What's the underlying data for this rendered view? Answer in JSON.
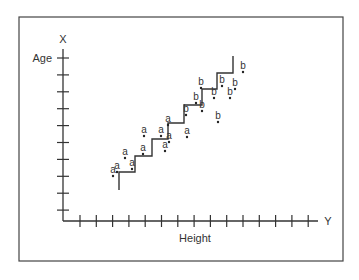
{
  "chart_data": {
    "type": "scatter",
    "title": "",
    "xlabel": "Height",
    "ylabel": "Age",
    "x_axis_name": "Y",
    "y_axis_name": "X",
    "grid": false,
    "legend": null,
    "x_ticks": 15,
    "y_ticks": 10,
    "series": [
      {
        "name": "a",
        "points": [
          {
            "x": 113,
            "y": 176
          },
          {
            "x": 117,
            "y": 172
          },
          {
            "x": 125,
            "y": 158
          },
          {
            "x": 132,
            "y": 169
          },
          {
            "x": 143,
            "y": 154
          },
          {
            "x": 144,
            "y": 136
          },
          {
            "x": 161,
            "y": 136
          },
          {
            "x": 168,
            "y": 125
          },
          {
            "x": 169,
            "y": 142
          },
          {
            "x": 165,
            "y": 151
          },
          {
            "x": 187,
            "y": 137
          }
        ]
      },
      {
        "name": "b",
        "points": [
          {
            "x": 243,
            "y": 72
          },
          {
            "x": 222,
            "y": 86
          },
          {
            "x": 235,
            "y": 89
          },
          {
            "x": 201,
            "y": 88
          },
          {
            "x": 214,
            "y": 98
          },
          {
            "x": 230,
            "y": 98
          },
          {
            "x": 196,
            "y": 103
          },
          {
            "x": 202,
            "y": 111
          },
          {
            "x": 186,
            "y": 115
          },
          {
            "x": 218,
            "y": 122
          }
        ]
      }
    ],
    "step_line": [
      [
        119,
        190
      ],
      [
        119,
        172
      ],
      [
        135,
        172
      ],
      [
        135,
        156
      ],
      [
        152,
        156
      ],
      [
        152,
        139
      ],
      [
        168,
        139
      ],
      [
        168,
        123
      ],
      [
        184,
        123
      ],
      [
        184,
        105
      ],
      [
        202,
        105
      ],
      [
        202,
        89
      ],
      [
        217,
        89
      ],
      [
        217,
        73
      ],
      [
        233,
        73
      ],
      [
        233,
        56
      ]
    ]
  },
  "labels": {
    "y_axis_letter": "X",
    "y_axis_title": "Age",
    "x_axis_letter": "Y",
    "x_axis_title": "Height"
  }
}
